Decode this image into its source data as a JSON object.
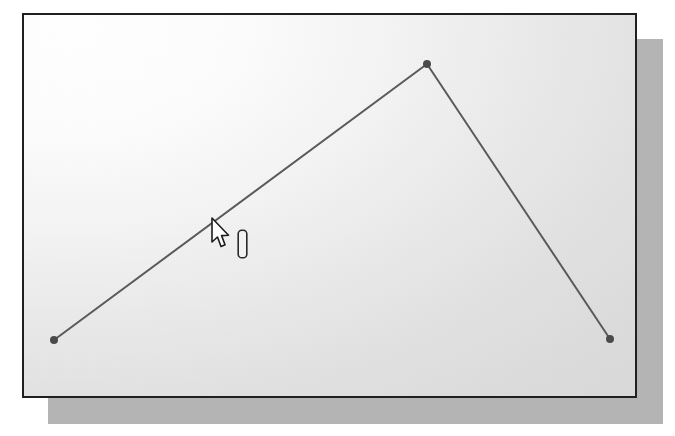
{
  "app": {
    "window_title": "Drawing Canvas",
    "surface_label": "drawing-canvas",
    "frame_border_color": "#202020",
    "shadow_color": "#b4b4b4",
    "canvas_color_light": "#ffffff",
    "canvas_color_dark": "#d7d7d7"
  },
  "geometry": {
    "stroke_color": "#5a5a5a",
    "stroke_width": 2,
    "vertex_marker_color": "#4a4a4a",
    "vertex_marker_radius": 4,
    "polyline_label": "polyline-3-vertices",
    "vertices": [
      {
        "name": "start-vertex",
        "x": 30,
        "y": 325
      },
      {
        "name": "apex-vertex",
        "x": 403,
        "y": 49
      },
      {
        "name": "end-vertex",
        "x": 586,
        "y": 324
      }
    ]
  },
  "cursor": {
    "pointer_icon": "arrow-pointer-icon",
    "pointer_x": 210,
    "pointer_y": 217,
    "pointer_fill": "#ffffff",
    "pointer_outline": "#1c1c1c",
    "snap_icon": "vertical-beam-icon",
    "snap_x": 237,
    "snap_y": 229,
    "snap_width": 9,
    "snap_height": 28,
    "snap_outline": "#2a2a2a",
    "snap_fill": "#f2f2f2"
  },
  "chart_data": {
    "type": "line",
    "title": "",
    "xlabel": "",
    "ylabel": "",
    "x": [
      30,
      403,
      586
    ],
    "y": [
      325,
      49,
      324
    ],
    "series": [
      {
        "name": "polyline",
        "points": [
          {
            "x": 30,
            "y": 325
          },
          {
            "x": 403,
            "y": 49
          },
          {
            "x": 586,
            "y": 324
          }
        ]
      }
    ],
    "markers": true,
    "grid": false,
    "legend": false,
    "xlim": [
      0,
      611
    ],
    "ylim": [
      0,
      381
    ]
  }
}
